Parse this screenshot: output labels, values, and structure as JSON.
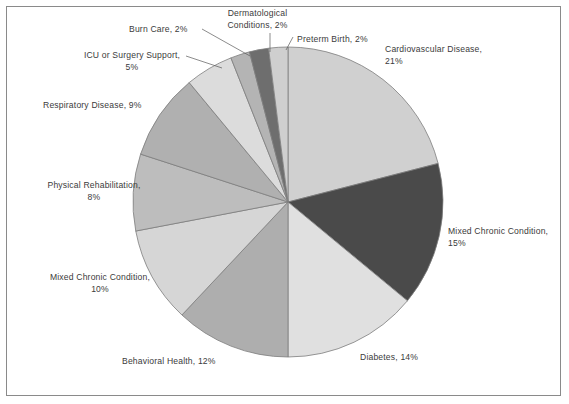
{
  "figure": {
    "border_color": "#8a8a8a",
    "background": "#ffffff",
    "text_color": "#3b3b3b"
  },
  "chart_data": {
    "type": "pie",
    "title": "",
    "subtitle": "",
    "xlabel": "",
    "ylabel": "",
    "legend_position": "none",
    "grid": false,
    "start_angle_deg": 90,
    "direction": "clockwise",
    "center_px": [
      288,
      202
    ],
    "radius_px": 155,
    "units": "percent",
    "total": 100,
    "categories": [
      "Cardiovascular Disease",
      "Mixed Chronic Condition",
      "Diabetes",
      "Behavioral Health",
      "Mixed Chronic Condition",
      "Physical Rehabilitation",
      "Respiratory Disease",
      "ICU or Surgery Support",
      "Burn Care",
      "Dermatological Conditions",
      "Preterm Birth"
    ],
    "values": [
      21,
      15,
      14,
      12,
      10,
      8,
      9,
      5,
      2,
      2,
      2
    ],
    "colors": [
      "#d0d0d0",
      "#4a4a4a",
      "#e0e0e0",
      "#aeaeae",
      "#d6d6d6",
      "#bdbdbd",
      "#b0b0b0",
      "#dcdcdc",
      "#b4b4b4",
      "#6e6e6e",
      "#cfcfcf"
    ],
    "slice_edge_color": "#7d7d7d",
    "labels": [
      {
        "name": "cardiovascular-disease",
        "line1": "Cardiovascular Disease,",
        "line2": "21%",
        "value": 21,
        "color": "#d0d0d0",
        "x": 385,
        "y": 44,
        "width": 180,
        "align": "left",
        "leader": false
      },
      {
        "name": "mixed-chronic-condition-15",
        "line1": "Mixed Chronic Condition,",
        "line2": "15%",
        "value": 15,
        "color": "#4a4a4a",
        "x": 448,
        "y": 226,
        "width": 120,
        "align": "left",
        "leader": false
      },
      {
        "name": "diabetes",
        "line1": "Diabetes, 14%",
        "line2": "",
        "value": 14,
        "color": "#e0e0e0",
        "x": 360,
        "y": 352,
        "width": 100,
        "align": "left",
        "leader": false
      },
      {
        "name": "behavioral-health",
        "line1": "Behavioral Health, 12%",
        "line2": "",
        "value": 12,
        "color": "#aeaeae",
        "x": 122,
        "y": 356,
        "width": 140,
        "align": "left",
        "leader": false
      },
      {
        "name": "mixed-chronic-condition-10",
        "line1": "Mixed Chronic Condition,",
        "line2": "10%",
        "value": 10,
        "color": "#d6d6d6",
        "x": 30,
        "y": 272,
        "width": 140,
        "align": "center",
        "leader": false
      },
      {
        "name": "physical-rehabilitation",
        "line1": "Physical Rehabilitation,",
        "line2": "8%",
        "value": 8,
        "color": "#bdbdbd",
        "x": 24,
        "y": 180,
        "width": 140,
        "align": "center",
        "leader": false
      },
      {
        "name": "respiratory-disease",
        "line1": "Respiratory Disease, 9%",
        "line2": "",
        "value": 9,
        "color": "#b0b0b0",
        "x": 43,
        "y": 100,
        "width": 145,
        "align": "left",
        "leader": false
      },
      {
        "name": "icu-or-surgery-support",
        "line1": "ICU or Surgery Support,",
        "line2": "5%",
        "value": 5,
        "color": "#dcdcdc",
        "x": 62,
        "y": 50,
        "width": 140,
        "align": "center",
        "leader": true
      },
      {
        "name": "burn-care",
        "line1": "Burn Care, 2%",
        "line2": "",
        "value": 2,
        "color": "#b4b4b4",
        "x": 129,
        "y": 24,
        "width": 90,
        "align": "left",
        "leader": true
      },
      {
        "name": "dermatological-conditions",
        "line1": "Dermatological",
        "line2": "Conditions, 2%",
        "value": 2,
        "color": "#6e6e6e",
        "x": 210,
        "y": 8,
        "width": 95,
        "align": "center",
        "leader": true
      },
      {
        "name": "preterm-birth",
        "line1": "Preterm Birth, 2%",
        "line2": "",
        "value": 2,
        "color": "#cfcfcf",
        "x": 297,
        "y": 34,
        "width": 110,
        "align": "left",
        "leader": true
      }
    ],
    "leader_lines": [
      {
        "name": "leader-icu-or-surgery-support",
        "x1": 186,
        "y1": 56,
        "x2": 222,
        "y2": 68
      },
      {
        "name": "leader-burn-care",
        "x1": 202,
        "y1": 29,
        "x2": 250,
        "y2": 56
      },
      {
        "name": "leader-dermatological-conditions",
        "x1": 270,
        "y1": 33,
        "x2": 270,
        "y2": 52
      },
      {
        "name": "leader-preterm-birth",
        "x1": 293,
        "y1": 37,
        "x2": 286,
        "y2": 50
      }
    ]
  }
}
